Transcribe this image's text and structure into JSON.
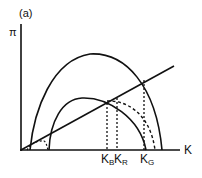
{
  "panel_label": "(a)",
  "axes": {
    "y_label": "π",
    "x_label": "K"
  },
  "x_ticks": [
    {
      "main": "K",
      "sub": "B"
    },
    {
      "main": "K",
      "sub": "R"
    },
    {
      "main": "K",
      "sub": "G"
    }
  ],
  "curves": [
    {
      "name": "outer-profit-curve",
      "style": "solid"
    },
    {
      "name": "inner-profit-curve",
      "style": "solid"
    },
    {
      "name": "shifted-profit-curve",
      "style": "dashed"
    },
    {
      "name": "cost-line",
      "style": "solid"
    }
  ],
  "colors": {
    "line": "#111111",
    "background": "#ffffff"
  }
}
